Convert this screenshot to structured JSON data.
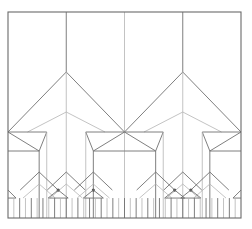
{
  "diagram": {
    "type": "crease-pattern",
    "frame": {
      "x": 8,
      "y": 12,
      "width": 233,
      "height": 206
    },
    "colors": {
      "primary_line": "#707070",
      "secondary_line": "#b4b4b4",
      "frame": "#6a6a6a",
      "background": "#ffffff"
    },
    "levels": [
      {
        "level": 1,
        "apex_y": 72,
        "base_y": 132,
        "units": 2
      },
      {
        "level": 2,
        "apex_y": 112,
        "base_y": 151,
        "units": 4
      },
      {
        "level": 3,
        "apex_y": 172,
        "base_y": 202,
        "units": 8
      }
    ]
  }
}
